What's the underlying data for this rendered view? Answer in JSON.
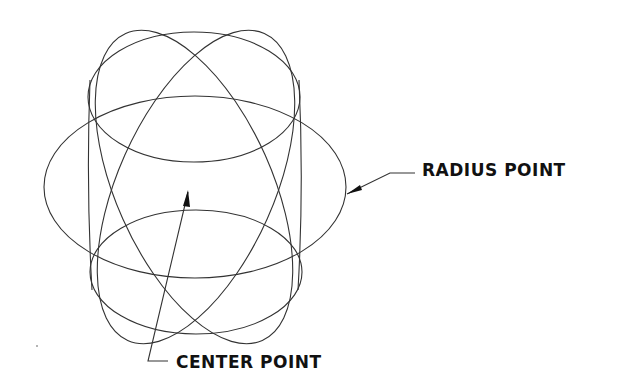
{
  "diagram": {
    "type": "CAD isometric sphere wireframe",
    "stroke_color": "#333333",
    "text_color": "#111111",
    "labels": {
      "radius_point": "RADIUS POINT",
      "center_point": "CENTER POINT"
    },
    "shapes": [
      {
        "name": "equator-ellipse",
        "cx": 195,
        "cy": 187,
        "rx": 151,
        "ry": 91,
        "rotate": 0
      },
      {
        "name": "top-cap-ellipse",
        "cx": 194,
        "cy": 97,
        "rx": 106,
        "ry": 65,
        "rotate": 0
      },
      {
        "name": "bottom-cap-ellipse",
        "cx": 196,
        "cy": 272,
        "rx": 106,
        "ry": 62,
        "rotate": 0
      },
      {
        "name": "meridian-ellipse-left",
        "cx": 194,
        "cy": 187,
        "rx": 75,
        "ry": 165,
        "rotate": -25
      },
      {
        "name": "meridian-ellipse-right",
        "cx": 196,
        "cy": 187,
        "rx": 75,
        "ry": 165,
        "rotate": 25
      }
    ]
  }
}
